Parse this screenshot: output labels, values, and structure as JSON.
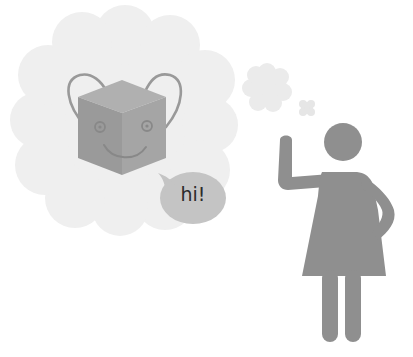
{
  "illustration": {
    "description": "Person waving, thinking of a smiling cube robot that says hi",
    "speech_bubble": {
      "text": "hi!"
    },
    "watermark": {
      "text": ""
    },
    "colors": {
      "background": "#ffffff",
      "thought_cloud": "#efefef",
      "small_cloud": "#ebebeb",
      "cube_front": "#9a9a9a",
      "cube_top": "#a8a8a8",
      "cube_right": "#a2a2a2",
      "cube_outline": "#8a8a8a",
      "speech_bubble": "#c4c4c4",
      "person": "#8f8f8f"
    }
  }
}
